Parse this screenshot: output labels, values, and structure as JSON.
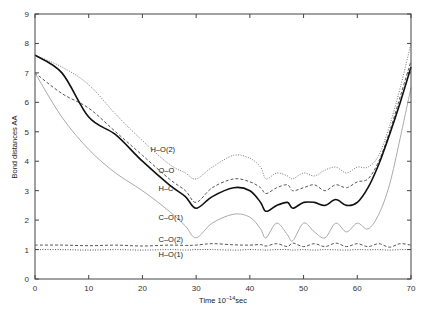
{
  "chart_data": {
    "type": "line",
    "title": "",
    "xlabel": "Time 10^-14 sec",
    "xlabel_parts": {
      "base": "Time 10",
      "sup": "−14",
      "unit": "sec"
    },
    "ylabel": "Bond distances AA",
    "xlim": [
      0,
      70
    ],
    "ylim": [
      0,
      9
    ],
    "xticks": [
      0,
      10,
      20,
      30,
      40,
      50,
      60,
      70
    ],
    "yticks": [
      0,
      1,
      2,
      3,
      4,
      5,
      6,
      7,
      8,
      9
    ],
    "grid": false,
    "legend": "inline labels",
    "x": [
      0,
      5,
      10,
      15,
      20,
      25,
      28,
      30,
      33,
      37,
      40,
      42,
      43,
      45,
      47,
      48,
      50,
      52,
      54,
      56,
      58,
      60,
      62,
      64,
      66,
      68,
      70
    ],
    "series": [
      {
        "name": "H–O(2)",
        "style": "dotted",
        "color": "#777777",
        "values": [
          7.6,
          7.2,
          6.6,
          5.6,
          4.7,
          3.9,
          3.6,
          3.4,
          3.8,
          4.2,
          4.1,
          3.8,
          3.4,
          3.6,
          3.5,
          3.4,
          3.6,
          3.5,
          3.7,
          3.8,
          3.6,
          3.8,
          3.8,
          4.2,
          5.2,
          6.5,
          8.0
        ]
      },
      {
        "name": "O–O",
        "style": "dashed",
        "color": "#555555",
        "values": [
          7.0,
          6.3,
          5.8,
          5.0,
          4.2,
          3.4,
          3.0,
          2.6,
          3.1,
          3.4,
          3.3,
          3.1,
          2.9,
          3.1,
          3.2,
          3.0,
          3.1,
          3.2,
          3.0,
          3.2,
          3.1,
          3.3,
          3.4,
          4.0,
          5.0,
          6.2,
          7.4
        ]
      },
      {
        "name": "H–C",
        "style": "solid",
        "color": "#111111",
        "values": [
          7.6,
          7.0,
          5.5,
          4.9,
          4.0,
          3.2,
          2.8,
          2.4,
          2.8,
          3.1,
          3.0,
          2.6,
          2.3,
          2.5,
          2.6,
          2.4,
          2.6,
          2.6,
          2.5,
          2.7,
          2.5,
          2.6,
          3.1,
          3.9,
          4.9,
          6.0,
          7.2
        ]
      },
      {
        "name": "C–O(1)",
        "style": "solid-light",
        "color": "#aaaaaa",
        "values": [
          7.0,
          5.5,
          4.4,
          3.6,
          3.0,
          2.3,
          1.8,
          1.4,
          1.9,
          2.2,
          2.1,
          1.7,
          1.4,
          1.9,
          1.5,
          1.3,
          1.9,
          1.6,
          1.4,
          1.9,
          1.6,
          1.9,
          1.7,
          2.2,
          3.2,
          4.8,
          6.5
        ]
      },
      {
        "name": "C–O(2)",
        "style": "dashed",
        "color": "#555555",
        "values": [
          1.15,
          1.15,
          1.13,
          1.15,
          1.12,
          1.15,
          1.14,
          1.15,
          1.2,
          1.16,
          1.15,
          1.17,
          1.12,
          1.2,
          1.1,
          1.22,
          1.1,
          1.2,
          1.1,
          1.22,
          1.1,
          1.2,
          1.1,
          1.2,
          1.08,
          1.2,
          1.15
        ]
      },
      {
        "name": "H–O(1)",
        "style": "dotted",
        "color": "#555555",
        "values": [
          1.0,
          1.0,
          0.98,
          1.0,
          0.98,
          1.0,
          0.98,
          1.0,
          1.0,
          0.98,
          1.0,
          0.99,
          0.98,
          1.0,
          1.0,
          0.98,
          1.0,
          0.98,
          1.0,
          0.99,
          0.98,
          1.0,
          0.99,
          1.0,
          0.98,
          1.0,
          1.0
        ]
      }
    ],
    "annotations": [
      {
        "text": "H–O(2)",
        "x": 21.5,
        "y": 4.3
      },
      {
        "text": "O–O",
        "x": 23,
        "y": 3.6
      },
      {
        "text": "H–C",
        "x": 23,
        "y": 3.0
      },
      {
        "text": "C–O(1)",
        "x": 23,
        "y": 2.0
      },
      {
        "text": "C–O(2)",
        "x": 23,
        "y": 1.25
      },
      {
        "text": "H–O(1)",
        "x": 23,
        "y": 0.75
      }
    ]
  }
}
